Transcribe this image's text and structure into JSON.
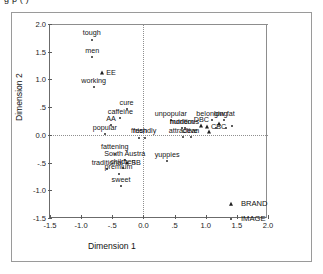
{
  "figure": {
    "clipped_title": "g                                p                                                                      ( )"
  },
  "legend": {
    "entries": [
      {
        "label": "BRAND",
        "marker": "triangle-up-icon"
      },
      {
        "label": "IMAGE",
        "marker": "dot-icon"
      }
    ]
  },
  "chart_data": {
    "type": "scatter",
    "title": "",
    "xlabel": "Dimension 1",
    "ylabel": "Dimension 2",
    "xlim": [
      -1.5,
      2.0
    ],
    "ylim": [
      -1.5,
      2.0
    ],
    "xticks": [
      "-1.5",
      "-1.0",
      "-.5",
      "0.0",
      ".5",
      "1.0",
      "1.5",
      "2.0"
    ],
    "xtick_values": [
      -1.5,
      -1.0,
      -0.5,
      0.0,
      0.5,
      1.0,
      1.5,
      2.0
    ],
    "yticks": [
      "-1.5",
      "-1.0",
      "-.5",
      "0.0",
      ".5",
      "1.0",
      "1.5",
      "2.0"
    ],
    "ytick_values": [
      -1.5,
      -1.0,
      -0.5,
      0.0,
      0.5,
      1.0,
      1.5,
      2.0
    ],
    "grid": false,
    "reference_lines": {
      "x": 0.0,
      "y": 0.0,
      "style": "dotted"
    },
    "legend_position": "bottom-right-outside",
    "series": [
      {
        "name": "IMAGE",
        "marker": "dot",
        "points": [
          {
            "label": "tough",
            "x": -0.83,
            "y": 1.72,
            "lpos": "top"
          },
          {
            "label": "men",
            "x": -0.82,
            "y": 1.4,
            "lpos": "top"
          },
          {
            "label": "working",
            "x": -0.8,
            "y": 0.86,
            "lpos": "top"
          },
          {
            "label": "cure",
            "x": -0.27,
            "y": 0.46,
            "lpos": "top"
          },
          {
            "label": "caffeine",
            "x": -0.37,
            "y": 0.3,
            "lpos": "top"
          },
          {
            "label": "AA",
            "x": -0.52,
            "y": 0.18,
            "lpos": "top"
          },
          {
            "label": "popular",
            "x": -0.62,
            "y": 0.02,
            "lpos": "top"
          },
          {
            "label": "fresh",
            "x": -0.07,
            "y": -0.05,
            "lpos": "top"
          },
          {
            "label": "friendly",
            "x": 0.02,
            "y": -0.05,
            "lpos": "top"
          },
          {
            "label": "fattening",
            "x": -0.46,
            "y": -0.34,
            "lpos": "top"
          },
          {
            "label": "South Austra",
            "x": -0.3,
            "y": -0.45,
            "lpos": "top"
          },
          {
            "label": "traditional",
            "x": -0.58,
            "y": -0.62,
            "lpos": "top"
          },
          {
            "label": "children",
            "x": -0.33,
            "y": -0.6,
            "lpos": "top"
          },
          {
            "label": "premium",
            "x": -0.4,
            "y": -0.7,
            "lpos": "top"
          },
          {
            "label": "sweet",
            "x": -0.36,
            "y": -0.92,
            "lpos": "top"
          },
          {
            "label": "unpopular",
            "x": 0.44,
            "y": 0.26,
            "lpos": "top"
          },
          {
            "label": "modern",
            "x": 0.62,
            "y": 0.12,
            "lpos": "top"
          },
          {
            "label": "nutritious",
            "x": 0.66,
            "y": 0.12,
            "lpos": "top"
          },
          {
            "label": "attractive",
            "x": 0.64,
            "y": -0.04,
            "lpos": "top"
          },
          {
            "label": "clean",
            "x": 0.76,
            "y": -0.04,
            "lpos": "top"
          },
          {
            "label": "belonging",
            "x": 1.1,
            "y": 0.26,
            "lpos": "top"
          },
          {
            "label": "low fat",
            "x": 1.3,
            "y": 0.26,
            "lpos": "top"
          },
          {
            "label": "yuppies",
            "x": 0.38,
            "y": -0.48,
            "lpos": "top"
          }
        ]
      },
      {
        "name": "BRAND",
        "marker": "triangle",
        "points": [
          {
            "label": "EE",
            "x": -0.66,
            "y": 1.12,
            "lpos": "right"
          },
          {
            "label": "SB",
            "x": -0.26,
            "y": -0.5,
            "lpos": "right"
          },
          {
            "label": "DBC",
            "x": 0.93,
            "y": 0.16,
            "lpos": "top"
          },
          {
            "label": "CBC",
            "x": 1.02,
            "y": 0.14,
            "lpos": "right"
          }
        ]
      }
    ],
    "unlabeled_markers": [
      {
        "series": "IMAGE",
        "x": 1.17,
        "y": 0.13
      },
      {
        "series": "IMAGE",
        "x": 1.33,
        "y": 0.13
      },
      {
        "series": "IMAGE",
        "x": 1.42,
        "y": 0.16
      },
      {
        "series": "BRAND",
        "x": 1.22,
        "y": 0.2
      },
      {
        "series": "BRAND",
        "x": 1.05,
        "y": 0.05
      }
    ]
  }
}
